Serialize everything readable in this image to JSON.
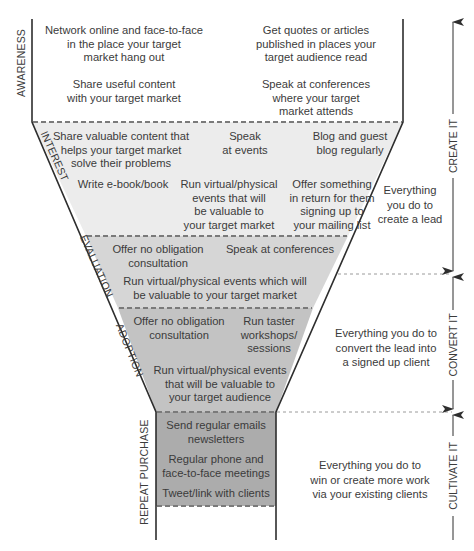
{
  "colors": {
    "awareness_fill": "#ffffff",
    "interest_fill": "#ececec",
    "evaluation_fill": "#d6d6d6",
    "adoption_fill": "#c3c3c3",
    "repeat_fill": "#acacac",
    "outline": "#2e2e2e",
    "dashed": "#7a7a7a"
  },
  "stages": {
    "awareness": {
      "label": "AWARENESS",
      "items": [
        [
          "Network online and face-to-face",
          "in the place your target",
          "market hang out"
        ],
        [
          "Get quotes or articles",
          "published in places your",
          "target audience read"
        ],
        [
          "Share useful content",
          "with your target market"
        ],
        [
          "Speak at conferences",
          "where your target",
          "market attends"
        ]
      ]
    },
    "interest": {
      "label": "INTEREST",
      "items": [
        [
          "Share valuable content that",
          "helps your target market",
          "solve their problems"
        ],
        [
          "Speak",
          "at events"
        ],
        [
          "Blog and guest",
          "blog regularly"
        ],
        [
          "Write e-book/book"
        ],
        [
          "Run virtual/physical",
          "events that will",
          "be valuable to",
          "your target market"
        ],
        [
          "Offer something",
          "in return for them",
          "signing up to",
          "your mailing list"
        ]
      ]
    },
    "evaluation": {
      "label": "EVALUATION",
      "items": [
        [
          "Offer no obligation",
          "consultation"
        ],
        [
          "Speak at conferences"
        ],
        [
          "Run virtual/physical events which will",
          "be valuable to your target market"
        ]
      ]
    },
    "adoption": {
      "label": "ADOPTION",
      "items": [
        [
          "Offer no obligation",
          "consultation"
        ],
        [
          "Run taster",
          "workshops/",
          "sessions"
        ],
        [
          "Run virtual/physical events",
          "that will be valuable to",
          "your target audience"
        ]
      ]
    },
    "repeat_purchase": {
      "label": "REPEAT PURCHASE",
      "items": [
        [
          "Send regular emails",
          "newsletters"
        ],
        [
          "Regular phone and",
          "face-to-face meetings"
        ],
        [
          "Tweet/link with clients"
        ]
      ]
    }
  },
  "phases": {
    "create": {
      "label": "CREATE IT",
      "description": [
        "Everything",
        "you do to",
        "create a lead"
      ]
    },
    "convert": {
      "label": "CONVERT IT",
      "description": [
        "Everything you do to",
        "convert the lead into",
        "a signed up client"
      ]
    },
    "cultivate": {
      "label": "CULTIVATE IT",
      "description": [
        "Everything you do to",
        "win or create more work",
        "via your existing clients"
      ]
    }
  }
}
